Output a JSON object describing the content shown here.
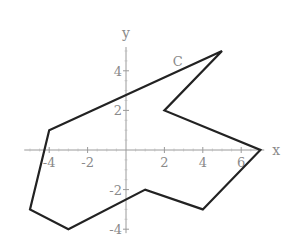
{
  "chart_data": {
    "type": "line",
    "title": "",
    "xlabel": "x",
    "ylabel": "y",
    "xlim": [
      -5.3,
      7.2
    ],
    "ylim": [
      -4.2,
      5.2
    ],
    "grid": false,
    "x_ticks": [
      -4,
      -2,
      2,
      4,
      6
    ],
    "y_ticks": [
      -4,
      -2,
      2,
      4
    ],
    "x_tick_labels": [
      "-4",
      "-2",
      "2",
      "4",
      "6"
    ],
    "y_tick_labels": [
      "-4",
      "-2",
      "2",
      "4"
    ],
    "series": [
      {
        "name": "C",
        "closed": true,
        "points": [
          [
            5,
            5
          ],
          [
            2,
            2
          ],
          [
            7,
            0
          ],
          [
            4,
            -3
          ],
          [
            1,
            -2
          ],
          [
            -3,
            -4
          ],
          [
            -5,
            -3
          ],
          [
            -4,
            1
          ]
        ]
      }
    ],
    "annotations": [
      {
        "text": "C",
        "x": 2.7,
        "y": 4.5
      }
    ]
  }
}
